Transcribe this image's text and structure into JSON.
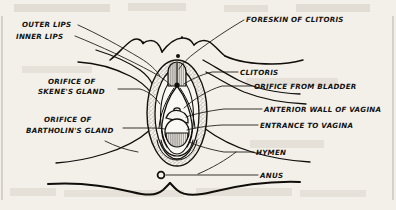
{
  "figure": {
    "background_color": "#f3f0ea",
    "ink_color": "#12100e",
    "style": "hand-drawn vintage line illustration with hand-lettered labels"
  },
  "labels": {
    "outer_lips": "OUTER LIPS",
    "inner_lips": "INNER LIPS",
    "skenes_gland_line1": "ORIFICE OF",
    "skenes_gland_line2": "SKENE'S GLAND",
    "bartholins_gland_line1": "ORIFICE OF",
    "bartholins_gland_line2": "BARTHOLIN'S GLAND",
    "foreskin_of_clitoris": "FORESKIN OF CLITORIS",
    "clitoris": "CLITORIS",
    "orifice_from_bladder": "ORIFICE FROM BLADDER",
    "anterior_wall_of_vagina": "ANTERIOR WALL OF VAGINA",
    "entrance_to_vagina": "ENTRANCE TO VAGINA",
    "hymen": "HYMEN",
    "anus": "ANUS"
  },
  "parts_list": [
    {
      "name": "outer-lips",
      "side": "left"
    },
    {
      "name": "inner-lips",
      "side": "left"
    },
    {
      "name": "orifice-of-skenes-gland",
      "side": "left"
    },
    {
      "name": "orifice-of-bartholins-gland",
      "side": "left"
    },
    {
      "name": "foreskin-of-clitoris",
      "side": "right"
    },
    {
      "name": "clitoris",
      "side": "right"
    },
    {
      "name": "orifice-from-bladder",
      "side": "right"
    },
    {
      "name": "anterior-wall-of-vagina",
      "side": "right"
    },
    {
      "name": "entrance-to-vagina",
      "side": "right"
    },
    {
      "name": "hymen",
      "side": "right"
    },
    {
      "name": "anus",
      "side": "right"
    }
  ]
}
